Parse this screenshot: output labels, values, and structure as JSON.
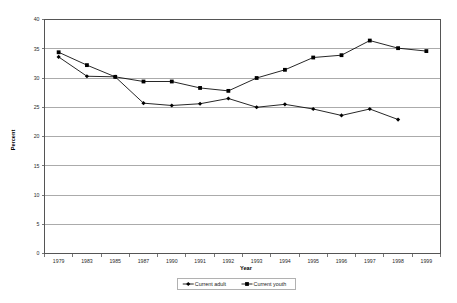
{
  "chart_data": {
    "type": "line",
    "title": "",
    "subtitle": "",
    "xlabel": "Year",
    "ylabel": "Percent",
    "categories": [
      "1979",
      "1983",
      "1985",
      "1987",
      "1990",
      "1991",
      "1992",
      "1993",
      "1994",
      "1995",
      "1996",
      "1997",
      "1998",
      "1999"
    ],
    "ylim": [
      0,
      40
    ],
    "yticks": [
      0,
      5,
      10,
      15,
      20,
      25,
      30,
      35,
      40
    ],
    "ytick_labels": [
      "0",
      "5",
      "10",
      "15",
      "20",
      "25",
      "30",
      "35",
      "40"
    ],
    "grid": true,
    "grid_axis": "y",
    "legend_position": "bottom",
    "series": [
      {
        "name": "Current adult",
        "marker": "diamond",
        "color": "#000000",
        "values": [
          33.6,
          30.3,
          30.2,
          25.7,
          25.3,
          25.6,
          26.5,
          25.0,
          25.5,
          24.7,
          23.6,
          24.7,
          22.9,
          null
        ]
      },
      {
        "name": "Current youth",
        "marker": "square",
        "color": "#000000",
        "values": [
          34.4,
          32.2,
          30.2,
          29.4,
          29.4,
          28.3,
          27.8,
          30.0,
          31.4,
          33.5,
          33.9,
          36.4,
          35.1,
          34.6
        ]
      }
    ]
  },
  "legend": {
    "entries": [
      {
        "label": "Current adult",
        "marker": "diamond"
      },
      {
        "label": "Current youth",
        "marker": "square"
      }
    ]
  },
  "axes": {
    "y_title": "Percent",
    "x_title": "Year"
  }
}
